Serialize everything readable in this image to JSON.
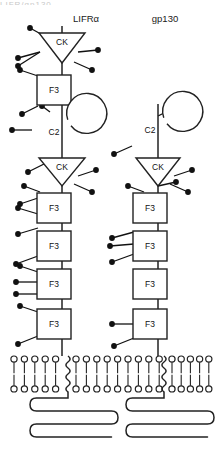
{
  "figure": {
    "type": "diagram",
    "background_color": "#ffffff",
    "stroke_color": "#222222",
    "glycan_color": "#111111",
    "top_cut_text": "LIFR/gp130"
  },
  "labels": {
    "left_chain": "LIFRα",
    "right_chain": "gp130"
  },
  "domain_names": {
    "ck": "CK",
    "c2": "C2",
    "f3": "F3"
  },
  "chains": [
    {
      "id": "lifr-alpha",
      "label": "LIFRα",
      "label_x": 86,
      "label_y": 22,
      "axis_x": 62,
      "stem_top": 26,
      "stem_bottom": 356,
      "domains": [
        {
          "kind": "ck",
          "name": "CK",
          "cx": 62,
          "cy": 48,
          "w": 46,
          "h": 30
        },
        {
          "kind": "f3",
          "name": "F3",
          "cx": 54,
          "cy": 90,
          "w": 34,
          "h": 30
        },
        {
          "kind": "c2",
          "name": "C2",
          "cx": 52,
          "cy": 132,
          "r": 20
        },
        {
          "kind": "ck",
          "name": "CK",
          "cx": 62,
          "cy": 172,
          "w": 46,
          "h": 28
        },
        {
          "kind": "f3",
          "name": "F3",
          "cx": 54,
          "cy": 208,
          "w": 34,
          "h": 30
        },
        {
          "kind": "f3",
          "name": "F3",
          "cx": 54,
          "cy": 246,
          "w": 34,
          "h": 30
        },
        {
          "kind": "f3",
          "name": "F3",
          "cx": 54,
          "cy": 284,
          "w": 34,
          "h": 30
        },
        {
          "kind": "f3",
          "name": "F3",
          "cx": 54,
          "cy": 324,
          "w": 34,
          "h": 30
        }
      ],
      "glycans": [
        {
          "x1": 48,
          "y1": 38,
          "x2": 30,
          "y2": 28
        },
        {
          "x1": 40,
          "y1": 52,
          "x2": 18,
          "y2": 58
        },
        {
          "x1": 40,
          "y1": 52,
          "x2": 18,
          "y2": 66
        },
        {
          "x1": 78,
          "y1": 52,
          "x2": 98,
          "y2": 50
        },
        {
          "x1": 74,
          "y1": 62,
          "x2": 92,
          "y2": 70
        },
        {
          "x1": 38,
          "y1": 76,
          "x2": 20,
          "y2": 70
        },
        {
          "x1": 38,
          "y1": 106,
          "x2": 22,
          "y2": 114
        },
        {
          "x1": 32,
          "y1": 130,
          "x2": 12,
          "y2": 130
        },
        {
          "x1": 50,
          "y1": 112,
          "x2": 42,
          "y2": 106
        },
        {
          "x1": 48,
          "y1": 162,
          "x2": 28,
          "y2": 172
        },
        {
          "x1": 78,
          "y1": 176,
          "x2": 96,
          "y2": 170
        },
        {
          "x1": 74,
          "y1": 184,
          "x2": 92,
          "y2": 192
        },
        {
          "x1": 40,
          "y1": 192,
          "x2": 24,
          "y2": 186
        },
        {
          "x1": 38,
          "y1": 198,
          "x2": 20,
          "y2": 204
        },
        {
          "x1": 38,
          "y1": 214,
          "x2": 18,
          "y2": 208
        },
        {
          "x1": 38,
          "y1": 228,
          "x2": 18,
          "y2": 234
        },
        {
          "x1": 38,
          "y1": 256,
          "x2": 16,
          "y2": 264
        },
        {
          "x1": 38,
          "y1": 272,
          "x2": 20,
          "y2": 266
        },
        {
          "x1": 38,
          "y1": 282,
          "x2": 16,
          "y2": 282
        },
        {
          "x1": 38,
          "y1": 294,
          "x2": 16,
          "y2": 294
        },
        {
          "x1": 38,
          "y1": 312,
          "x2": 20,
          "y2": 306
        },
        {
          "x1": 38,
          "y1": 336,
          "x2": 18,
          "y2": 344
        }
      ]
    },
    {
      "id": "gp130",
      "label": "gp130",
      "label_x": 165,
      "label_y": 22,
      "axis_x": 158,
      "stem_top": 104,
      "stem_bottom": 356,
      "domains": [
        {
          "kind": "c2",
          "name": "C2",
          "cx": 148,
          "cy": 130,
          "r": 20
        },
        {
          "kind": "ck",
          "name": "CK",
          "cx": 158,
          "cy": 172,
          "w": 44,
          "h": 28
        },
        {
          "kind": "f3",
          "name": "F3",
          "cx": 150,
          "cy": 208,
          "w": 34,
          "h": 30
        },
        {
          "kind": "f3",
          "name": "F3",
          "cx": 150,
          "cy": 246,
          "w": 34,
          "h": 30
        },
        {
          "kind": "f3",
          "name": "F3",
          "cx": 150,
          "cy": 284,
          "w": 34,
          "h": 30
        },
        {
          "kind": "f3",
          "name": "F3",
          "cx": 150,
          "cy": 324,
          "w": 34,
          "h": 30
        }
      ],
      "glycans": [
        {
          "x1": 158,
          "y1": 116,
          "x2": 178,
          "y2": 106
        },
        {
          "x1": 132,
          "y1": 146,
          "x2": 114,
          "y2": 154
        },
        {
          "x1": 174,
          "y1": 176,
          "x2": 192,
          "y2": 170
        },
        {
          "x1": 170,
          "y1": 184,
          "x2": 188,
          "y2": 192
        },
        {
          "x1": 144,
          "y1": 192,
          "x2": 128,
          "y2": 186
        },
        {
          "x1": 158,
          "y1": 186,
          "x2": 176,
          "y2": 182
        },
        {
          "x1": 134,
          "y1": 232,
          "x2": 112,
          "y2": 238
        },
        {
          "x1": 134,
          "y1": 244,
          "x2": 110,
          "y2": 246
        },
        {
          "x1": 134,
          "y1": 254,
          "x2": 112,
          "y2": 262
        },
        {
          "x1": 134,
          "y1": 324,
          "x2": 112,
          "y2": 324
        },
        {
          "x1": 134,
          "y1": 338,
          "x2": 114,
          "y2": 346
        }
      ]
    }
  ],
  "membrane": {
    "top_y": 356,
    "bottom_y": 392,
    "head_radius": 3.1,
    "segments": [
      {
        "id": "left",
        "start_x": 14,
        "count": 5,
        "spacing": 10.4
      },
      {
        "id": "middle",
        "start_x": 76,
        "count": 9,
        "spacing": 10.4
      },
      {
        "id": "right",
        "start_x": 172,
        "count": 5,
        "spacing": 9.2
      }
    ],
    "breaks": [
      {
        "x": 68,
        "chain": "lifr-alpha"
      },
      {
        "x": 164,
        "chain": "gp130"
      }
    ]
  },
  "cytoplasmic_tails": [
    {
      "id": "lifr-tail",
      "x": 68,
      "loops": 3,
      "left_x": 30,
      "right_x": 118,
      "top_y": 398
    },
    {
      "id": "gp130-tail",
      "x": 164,
      "loops": 3,
      "left_x": 126,
      "right_x": 214,
      "top_y": 398
    }
  ]
}
